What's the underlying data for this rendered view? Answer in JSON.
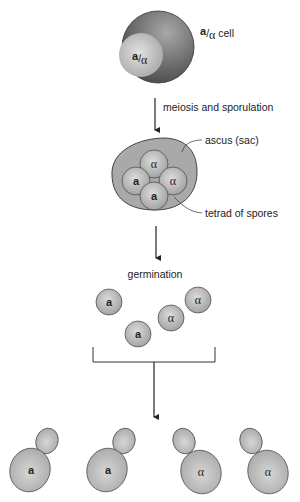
{
  "diagram": {
    "diploid_cell": {
      "label_prefix": "a",
      "label_slash": "/",
      "label_alpha": "α",
      "label_suffix": " cell",
      "inner_prefix": "a",
      "inner_slash": "/",
      "inner_alpha": "α"
    },
    "step1": {
      "label": "meiosis and sporulation"
    },
    "ascus": {
      "label": "ascus (sac)",
      "spores_label": "tetrad of spores",
      "spores": [
        "α",
        "a",
        "α",
        "a"
      ]
    },
    "step2": {
      "label": "germination"
    },
    "free_spores": [
      "a",
      "a",
      "α",
      "α"
    ],
    "budding_cells": [
      "a",
      "a",
      "α",
      "α"
    ],
    "colors": {
      "diploid_dark": "#5a5a5a",
      "diploid_light": "#c8c8c8",
      "spore_fill": "#b8b8b8",
      "ascus_fill": "#a9a9a9",
      "outline": "#3a3a3a"
    }
  }
}
